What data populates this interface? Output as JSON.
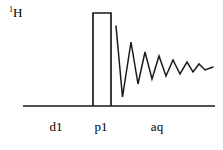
{
  "figure": {
    "kind": "nmr-pulse-sequence",
    "background_color": "#ffffff",
    "stroke_color": "#1a1a1a",
    "stroke_width": 1.6
  },
  "channel": {
    "nucleus_superscript": "1",
    "nucleus_symbol": "H",
    "nucleus_label": "1H"
  },
  "timeline": {
    "baseline_y": 106,
    "x_start": 23,
    "x_end": 215,
    "segments": [
      {
        "id": "d1",
        "label": "d1",
        "label_x": 56,
        "label_y": 130,
        "x_start": 23,
        "x_end": 93
      },
      {
        "id": "p1",
        "label": "p1",
        "label_x": 101,
        "label_y": 130,
        "x_start": 93,
        "x_end": 111
      },
      {
        "id": "aq",
        "label": "aq",
        "label_x": 157,
        "label_y": 130,
        "x_start": 111,
        "x_end": 215
      }
    ]
  },
  "pulse": {
    "name": "p1",
    "x_left": 93,
    "x_right": 111,
    "y_top": 13,
    "y_bottom": 106,
    "filled": false
  },
  "fid": {
    "name": "aq",
    "description": "damped oscillating free induction decay",
    "points": [
      [
        116,
        26
      ],
      [
        122.5,
        97
      ],
      [
        131,
        42
      ],
      [
        138,
        84
      ],
      [
        145,
        52
      ],
      [
        152,
        79
      ],
      [
        159,
        56
      ],
      [
        166,
        76
      ],
      [
        173,
        60
      ],
      [
        180,
        74
      ],
      [
        187,
        62
      ],
      [
        193,
        72
      ],
      [
        199,
        64
      ],
      [
        205,
        70
      ],
      [
        213,
        67
      ]
    ]
  },
  "chart_data": {
    "type": "line",
    "xlabel": "time",
    "ylabel": "RF amplitude / signal",
    "grid": false,
    "legend": "none",
    "xlim": [
      23,
      215
    ],
    "ylim": [
      13,
      106
    ],
    "annotations": [
      "1H",
      "d1",
      "p1",
      "aq"
    ],
    "series": [
      {
        "name": "baseline",
        "x": [
          23,
          215
        ],
        "y": [
          106,
          106
        ]
      },
      {
        "name": "p1-pulse",
        "x": [
          93,
          93,
          111,
          111
        ],
        "y": [
          106,
          13,
          13,
          106
        ]
      },
      {
        "name": "aq-fid",
        "x": [
          116,
          122.5,
          131,
          138,
          145,
          152,
          159,
          166,
          173,
          180,
          187,
          193,
          199,
          205,
          213
        ],
        "y": [
          26,
          97,
          42,
          84,
          52,
          79,
          56,
          76,
          60,
          74,
          62,
          72,
          64,
          70,
          67
        ]
      }
    ]
  }
}
